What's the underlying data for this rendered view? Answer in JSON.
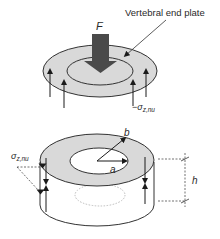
{
  "diagram": {
    "top_figure": {
      "force_label": "F",
      "callout_label": "Vertebral end plate",
      "stress_label_prefix": "−σ",
      "stress_label_sub": "z,nu"
    },
    "bottom_figure": {
      "outer_radius_label": "b",
      "inner_radius_label": "a",
      "height_label": "h",
      "stress_label_prefix": "σ",
      "stress_label_sub": "z,nu"
    },
    "colors": {
      "annulus_fill": "#d9d9d9",
      "line": "#333333",
      "arrow": "#1a1a1a",
      "force_arrow": "#4a4a4a"
    }
  }
}
